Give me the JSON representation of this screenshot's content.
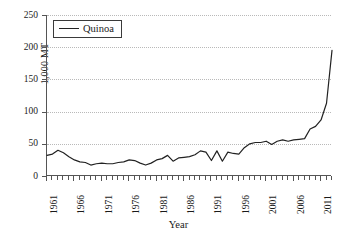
{
  "chart_data": {
    "type": "line",
    "title": "",
    "xlabel": "Year",
    "ylabel": "1,000 MT",
    "ylim": [
      0,
      250
    ],
    "yticks": [
      0,
      50,
      100,
      150,
      200,
      250
    ],
    "xlim": [
      1961,
      2013
    ],
    "xticks": [
      1961,
      1966,
      1971,
      1976,
      1981,
      1986,
      1991,
      1996,
      2001,
      2006,
      2011
    ],
    "grid": "horizontal-dotted",
    "legend": [
      "Quinoa"
    ],
    "legend_position": "top-left-inside",
    "series": [
      {
        "name": "Quinoa",
        "color": "#222222",
        "x": [
          1961,
          1962,
          1963,
          1964,
          1965,
          1966,
          1967,
          1968,
          1969,
          1970,
          1971,
          1972,
          1973,
          1974,
          1975,
          1976,
          1977,
          1978,
          1979,
          1980,
          1981,
          1982,
          1983,
          1984,
          1985,
          1986,
          1987,
          1988,
          1989,
          1990,
          1991,
          1992,
          1993,
          1994,
          1995,
          1996,
          1997,
          1998,
          1999,
          2000,
          2001,
          2002,
          2003,
          2004,
          2005,
          2006,
          2007,
          2008,
          2009,
          2010,
          2011,
          2012,
          2013
        ],
        "values": [
          32,
          34,
          40,
          36,
          30,
          25,
          22,
          21,
          17,
          19,
          20,
          19,
          19,
          21,
          22,
          25,
          24,
          20,
          17,
          20,
          25,
          27,
          32,
          23,
          28,
          29,
          30,
          33,
          39,
          37,
          24,
          39,
          23,
          37,
          35,
          34,
          44,
          50,
          52,
          52,
          54,
          49,
          54,
          56,
          54,
          56,
          57,
          58,
          73,
          77,
          87,
          113,
          195
        ]
      }
    ]
  },
  "axes": {
    "y_title": "1,000 MT",
    "x_title": "Year",
    "y_tick_labels": [
      "0",
      "50",
      "100",
      "150",
      "200",
      "250"
    ],
    "x_tick_labels": [
      "1961",
      "1966",
      "1971",
      "1976",
      "1981",
      "1986",
      "1991",
      "1996",
      "2001",
      "2006",
      "2011"
    ]
  },
  "legend": {
    "entries": [
      {
        "label": "Quinoa",
        "swatch": "line-swatch"
      }
    ]
  },
  "caption": ""
}
